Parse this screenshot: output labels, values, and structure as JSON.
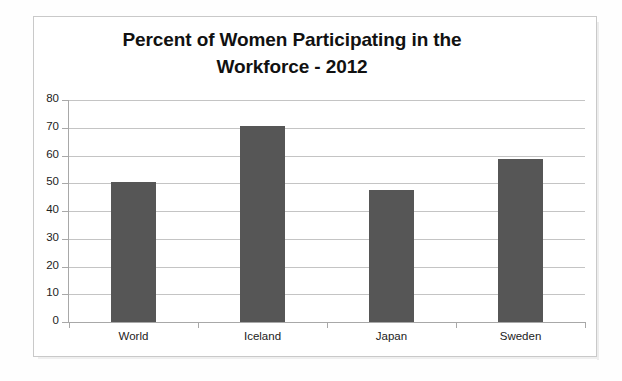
{
  "document": {
    "background_color": "#ffffff",
    "frame_color": "#c9c9c9"
  },
  "chart_data": {
    "type": "bar",
    "title": "Percent of Women Participating in the Workforce - 2012",
    "title_line1": "Percent of Women Participating in the",
    "title_line2": "Workforce - 2012",
    "categories": [
      "World",
      "Iceland",
      "Japan",
      "Sweden"
    ],
    "values": [
      50.3,
      70.5,
      47.5,
      58.8
    ],
    "series": [
      {
        "name": "Percent of women participating in the workforce",
        "values": [
          50.3,
          70.5,
          47.5,
          58.8
        ],
        "color": "#565656"
      }
    ],
    "xlabel": "",
    "ylabel": "",
    "ylim": [
      0,
      80
    ],
    "ytick_step": 10,
    "yticks": [
      80,
      70,
      60,
      50,
      40,
      30,
      20,
      10,
      0
    ],
    "ytick_labels": [
      "80",
      "70",
      "60",
      "50",
      "40",
      "30",
      "20",
      "10",
      "0"
    ],
    "grid": true,
    "grid_orientation": "horizontal",
    "grid_color": "#c4c4c4",
    "legend": false,
    "legend_position": "none",
    "bar_color": "#565656",
    "units": "percent"
  }
}
